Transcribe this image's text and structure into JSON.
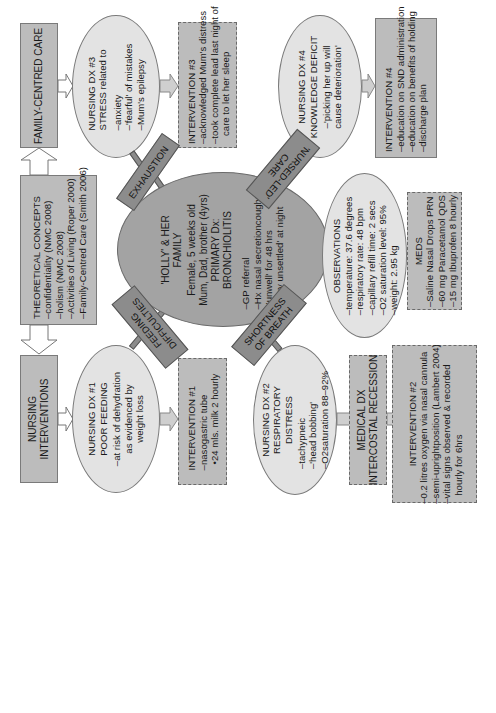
{
  "top_row": {
    "family_centred_care": "FAMILY-CENTRED CARE",
    "theoretical_concepts": {
      "title": "THEORETICAL CONCEPTS",
      "items": [
        "–confidentiality (NMC 2008)",
        "–holism (NMC 2008)",
        "–Activities of Living (Roper 2000)",
        "–Family-Centred Care (Smith 2006)"
      ]
    },
    "nursing_interventions": [
      "NURSING",
      "INTERVENTIONS"
    ]
  },
  "center": {
    "lines": [
      "'HOLLY' & HER",
      "FAMILY",
      "Female, 5 weeks old",
      "Mum, Dad, brother (4yrs)",
      "PRIMARY Dx:",
      "BRONCHIOLITIS"
    ],
    "items": [
      "–GP referral",
      "–Hx nasal secretioncough",
      "–'unwell' for 48 hrs",
      "–'very unsettled' at night"
    ]
  },
  "tags": {
    "exhaustion": "EXHAUSTION",
    "nursed_led_care": [
      "'NURSED-LED'",
      "CARE"
    ],
    "feeding_difficulties": [
      "FEEDING",
      "DIFFICULTIES"
    ],
    "shortness_of_breath": [
      "SHORTNESS",
      "OF BREATH"
    ]
  },
  "ndx3": {
    "title": [
      "NURSING DX #3",
      "STRESS related to"
    ],
    "items": [
      "–anxiety",
      "–'fearful' of mistakes",
      "–Mum's epilepsy"
    ]
  },
  "int3": {
    "title": "INTERVENTION #3",
    "items": [
      "–acknowledged Mum's distress",
      "–took complete lead last night of",
      "care to let her sleep"
    ]
  },
  "ndx4": {
    "title": [
      "NURSING DX #4",
      "KNOWLEDGE DEFICIT"
    ],
    "items": [
      "–'picking her up will",
      "cause deterioration'"
    ]
  },
  "int4": {
    "title": "INTERVENTION #4",
    "items": [
      "–education on SND administration",
      "–education on benefits of holding",
      "–discharge plan"
    ]
  },
  "observations": {
    "title": "OBSERVATIONS",
    "items": [
      "–temperature: 37.6 degrees",
      "–respiratory rate: 48 bpm",
      "–capillary refill time: 2 secs",
      "–O2 saturation level: 95%",
      "–weight: 2.95 kg"
    ]
  },
  "meds": {
    "title": "MEDS",
    "items": [
      "–Saline Nasal Drops PRN",
      "–60 mg Paracetamol QDS",
      "–15 mg  Ibuprofen 8 hourly"
    ]
  },
  "ndx1": {
    "title": [
      "NURSING DX #1",
      "POOR FEEDING"
    ],
    "items": [
      "–at risk of dehydration",
      "as evidenced by",
      "weight loss"
    ]
  },
  "int1": {
    "title": "INTERVENTION #1",
    "items": [
      "–nasogastric tube",
      "•24 mls. milk 2 hourly"
    ]
  },
  "ndx2": {
    "title": [
      "NURSING DX #2",
      "RESPIRATORY",
      "DISTRESS"
    ],
    "items": [
      "–tachypneic",
      "–'head bobbing'",
      "–O2saturation 88–92%"
    ]
  },
  "medical_dx": [
    "MEDICAL DX",
    "INTERCOSTAL RECESSION"
  ],
  "int2": {
    "title": "INTERVENTION #2",
    "items": [
      "–0.2 litres oxygen via nasal cannula",
      "–semi-uprightposition (Lambert 2004)",
      "–vital signs observed & recorded",
      "hourly for 6hrs"
    ]
  },
  "colors": {
    "box": "#bcbcbc",
    "ellipse": "#e3e3e3",
    "center": "#a3a3a3",
    "tag": "#8c8c8c"
  }
}
